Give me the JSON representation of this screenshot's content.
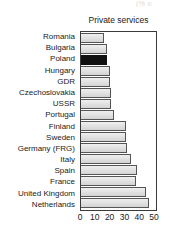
{
  "top_fragment": "(% o",
  "chart_data": {
    "type": "bar",
    "orientation": "horizontal",
    "title": "Private services",
    "xlabel": "",
    "ylabel": "",
    "xlim": [
      0,
      52
    ],
    "xticks": [
      0,
      10,
      20,
      30,
      40,
      50
    ],
    "grid": false,
    "legend": "none",
    "highlight_category": "Poland",
    "highlight_color": "#111111",
    "bar_color": "#e3e3e3",
    "bar_edge_color": "#555555",
    "categories": [
      "Romania",
      "Bulgaria",
      "Poland",
      "Hungary",
      "GDR",
      "Czechoslovakia",
      "USSR",
      "Portugal",
      "Finland",
      "Sweden",
      "Germany (FRG)",
      "Italy",
      "Spain",
      "France",
      "United Kingdom",
      "Netherlands"
    ],
    "values": [
      16,
      18,
      18,
      20,
      20,
      21,
      21,
      23,
      31,
      31,
      32,
      35,
      39,
      38,
      45,
      47
    ]
  }
}
